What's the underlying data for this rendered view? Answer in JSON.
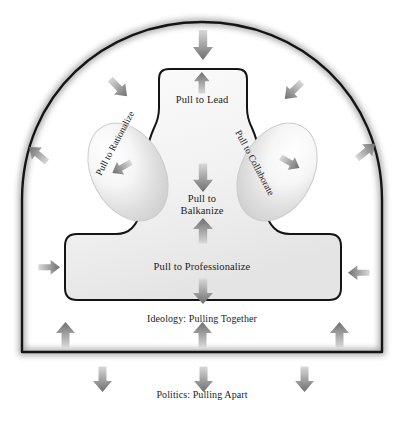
{
  "diagram": {
    "nodes": {
      "lead": "Pull to Lead",
      "balkanize_line1": "Pull to",
      "balkanize_line2": "Balkanize",
      "professionalize": "Pull to Professionalize",
      "rationalize": "Pull to Rationalize",
      "collaborate": "Pull to Collaborate"
    },
    "captions": {
      "inner": "Ideology: Pulling Together",
      "outer": "Politics: Pulling Apart"
    },
    "colors": {
      "outline": "#1a1a1a",
      "shape_fill_light": "#fbfbfb",
      "shape_fill_dark": "#e2e2e2",
      "arrow_dark": "#7a7a7a",
      "arrow_light": "#d8d8d8",
      "text": "#1c1c1c",
      "background": "#ffffff"
    },
    "arrows": {
      "top_inward": "arrow-down-icon",
      "lead_up": "arrow-up-icon",
      "upper_left_inward": "arrow-down-right-icon",
      "upper_right_inward": "arrow-down-left-icon",
      "mid_left_outward": "arrow-up-left-icon",
      "mid_right_outward": "arrow-up-right-icon",
      "lower_left_inward": "arrow-right-icon",
      "lower_right_inward": "arrow-left-icon",
      "rationalize_inward": "arrow-down-left-icon",
      "collaborate_inward": "arrow-down-right-icon",
      "balkanize_down": "arrow-down-icon",
      "balkanize_up": "arrow-up-icon",
      "professionalize_down": "arrow-down-icon",
      "base_up_center": "arrow-up-icon",
      "base_up_left": "arrow-up-icon",
      "base_up_right": "arrow-up-icon",
      "base_down_left": "arrow-down-icon",
      "base_down_center": "arrow-down-icon",
      "base_down_right": "arrow-down-icon"
    }
  }
}
